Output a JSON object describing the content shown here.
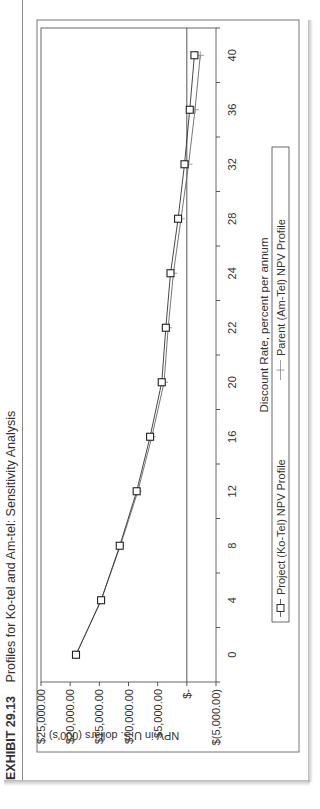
{
  "exhibit": {
    "number": "EXHIBIT 29.13",
    "title": "Profiles for Ko-tel and Am-tel: Sensitivity Analysis"
  },
  "chart_data": {
    "type": "line",
    "title": "Profiles for Ko-tel and Am-tel: Sensitivity Analysis",
    "xlabel": "Discount Rate, percent per annum",
    "ylabel": "NPV in U.S. dollars (000's)",
    "categories": [
      0,
      4,
      8,
      12,
      16,
      20,
      22,
      24,
      28,
      32,
      36,
      40
    ],
    "y_ticks": [
      "$25,000.00",
      "$20,000.00",
      "$15,000.00",
      "$10,000.00",
      "$5,000.00",
      "$-",
      "$(5,000.00)"
    ],
    "ylim": [
      -5000,
      25000
    ],
    "grid": false,
    "legend_position": "bottom",
    "series": [
      {
        "name": "Project (Ko-Tel) NPV Profile",
        "marker": "square",
        "values": [
          19000,
          14700,
          11500,
          8600,
          6300,
          4300,
          3600,
          2800,
          1500,
          400,
          -500,
          -1300
        ]
      },
      {
        "name": "Parent (Am-Tel) NPV Profile",
        "marker": "plus",
        "values": [
          19000,
          14700,
          11400,
          8400,
          6000,
          3900,
          3200,
          2300,
          1000,
          -300,
          -1400,
          -2300
        ]
      }
    ]
  },
  "legend": {
    "project_label": "Project (Ko-Tel)  NPV Profile",
    "parent_label": "Parent (Am-Tel)  NPV Profile"
  }
}
